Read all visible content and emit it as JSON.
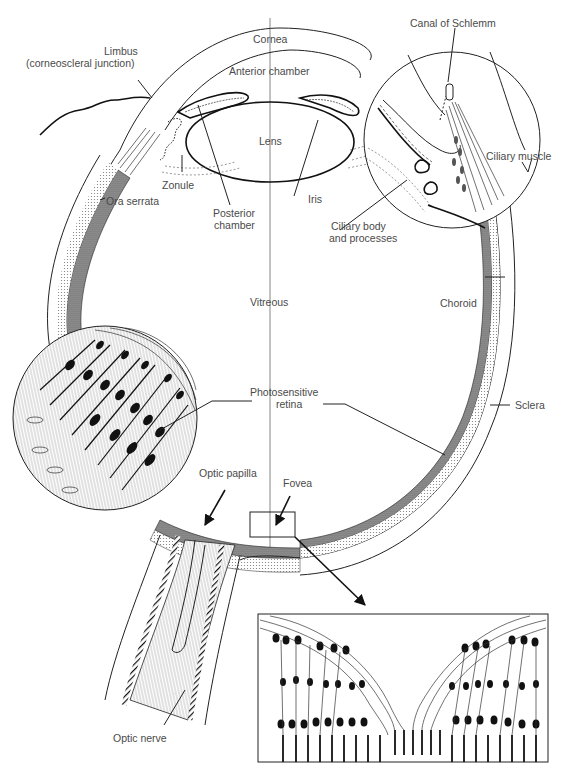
{
  "diagram": {
    "colors": {
      "ink": "#111111",
      "label": "#4a4a4a",
      "choroid_fill": "#8a8a8a",
      "retina_fill": "#c8c8c8",
      "background": "#ffffff"
    },
    "labels": {
      "cornea": "Cornea",
      "limbus_line1": "Limbus",
      "limbus_line2": "(corneoscleral junction)",
      "anterior_chamber": "Anterior chamber",
      "canal_of_schlemm": "Canal of Schlemm",
      "lens": "Lens",
      "iris": "Iris",
      "ciliary_muscle": "Ciliary muscle",
      "zonule": "Zonule",
      "ora_serrata": "Ora serrata",
      "posterior_chamber_line1": "Posterior",
      "posterior_chamber_line2": "chamber",
      "ciliary_body_line1": "Ciliary body",
      "ciliary_body_line2": "and processes",
      "vitreous": "Vitreous",
      "choroid": "Choroid",
      "photosensitive_retina_line1": "Photosensitive",
      "photosensitive_retina_line2": "retina",
      "sclera": "Sclera",
      "optic_papilla": "Optic papilla",
      "fovea": "Fovea",
      "optic_nerve": "Optic nerve"
    },
    "insets": [
      {
        "name": "ciliary-region-magnified",
        "shape": "circle",
        "cx": 452,
        "cy": 140,
        "r": 88
      },
      {
        "name": "retina-cells-magnified",
        "shape": "circle",
        "cx": 105,
        "cy": 418,
        "r": 92
      },
      {
        "name": "fovea-magnified",
        "shape": "rect",
        "x": 258,
        "y": 614,
        "w": 290,
        "h": 148
      }
    ]
  }
}
